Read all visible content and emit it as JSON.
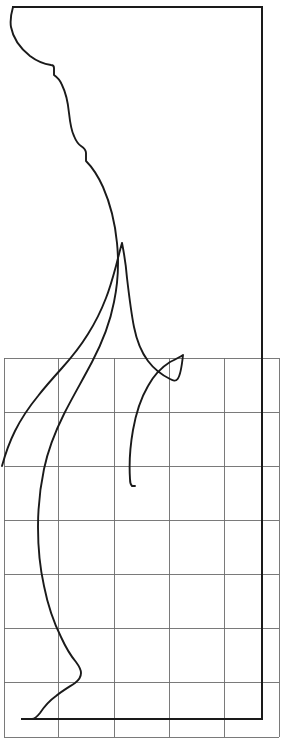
{
  "document": {
    "title": "Moulding Profile Template",
    "description": "Line drawing of a curved moulding cross-section profile over a square measuring grid",
    "background_color": "#ffffff",
    "line_color": "#1a1a1a",
    "grid_color": "#6b6b6b",
    "width": 288,
    "height": 741
  },
  "figure": {
    "name": "profile-drawing",
    "outer_profile_label": "outer profile curve",
    "inner_profile_label": "inner profile curve",
    "right_edge_label": "right vertical edge",
    "top_edge_label": "top horizontal edge",
    "bottom_edge_label": "bottom horizontal edge"
  },
  "grid": {
    "label": "measuring grid",
    "left": 4,
    "right": 279,
    "top": 358,
    "bottom": 737,
    "columns": 5,
    "rows": 7,
    "x_lines": [
      4,
      58,
      114,
      169,
      224,
      279
    ],
    "y_lines": [
      358,
      412,
      466,
      520,
      574,
      628,
      682,
      737
    ],
    "cell_width": 55,
    "cell_height": 54
  },
  "paths": {
    "outer_profile": "M 13,7 C 11,14 10,21 11,27 C 13,38 20,48 30,56 C 38,62 44,64 51,65 C 53,65 54,66 54,68 L 54,75 C 57,77 60,80 62,85 C 66,93 68,103 69,113 C 70,122 71,130 74,136 C 76,141 78,144 81,146 C 84,148 86,150 86,153 L 86,161 C 92,167 98,176 103,187 C 110,203 115,222 117,243 C 119,263 118,283 114,302 C 110,323 102,343 92,362 C 82,381 72,398 64,414 C 55,432 48,450 44,469 C 40,488 38,508 38,527 C 38,548 40,568 44,586 C 48,606 54,623 61,637 C 66,648 71,656 76,662 C 79,666 81,669 81,673 C 81,677 79,680 75,683 C 69,687 62,691 56,696 C 49,701 44,707 40,713 C 36,718 34,719 32,719 L 22,719",
    "inner_profile": "M 122,243 C 120,250 118,258 116,266 C 113,277 110,288 106,298 C 101,311 95,323 88,334 C 80,347 71,358 62,368 C 53,378 45,387 38,396 C 29,407 21,419 15,431 C 9,443 5,455 2,466 M 122,243 C 124,253 126,265 127,278 C 129,295 131,312 134,327 C 137,342 142,353 148,361 C 154,369 162,375 170,379 C 176,382 180,384 183,355 L 183,355 C 180,357 176,359 170,362 C 162,367 154,375 148,386 C 141,398 136,413 133,430 C 130,447 129,464 130,479 C 130,483 131,485 132,486 L 135,486",
    "right_edge": "M 262,7 L 262,719",
    "top_edge": "M 13,7 L 262,7",
    "bottom_edge": "M 22,719 L 262,719",
    "inner_tip_right": "M 183,355 L 188,356 L 183,358"
  },
  "annotations": {
    "visible_text": []
  }
}
